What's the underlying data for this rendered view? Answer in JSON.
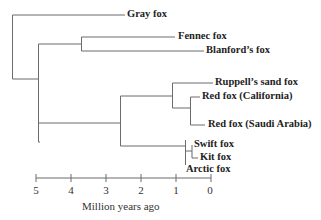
{
  "diagram": {
    "type": "phylogenetic-tree",
    "taxa": [
      {
        "id": "gray",
        "label": "Gray fox"
      },
      {
        "id": "fennec",
        "label": "Fennec fox"
      },
      {
        "id": "blanford",
        "label": "Blanford’s fox"
      },
      {
        "id": "ruppell",
        "label": "Ruppell’s sand fox"
      },
      {
        "id": "redcal",
        "label": "Red fox (California)"
      },
      {
        "id": "redsaudi",
        "label": "Red fox (Saudi  Arabia)"
      },
      {
        "id": "swift",
        "label": "Swift fox"
      },
      {
        "id": "kit",
        "label": "Kit fox"
      },
      {
        "id": "arctic",
        "label": "Arctic fox"
      }
    ],
    "axis": {
      "title": "Million years ago",
      "ticks": [
        "5",
        "4",
        "3",
        "2",
        "1",
        "0"
      ]
    },
    "line_color": "#666666",
    "text_color": "#222222"
  }
}
